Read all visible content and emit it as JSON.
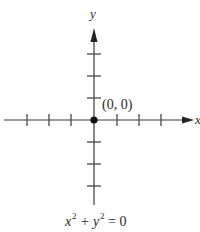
{
  "diagram": {
    "type": "coordinate-plane",
    "axes": {
      "x_label": "x",
      "y_label": "y",
      "x_ticks_each_side": 3,
      "y_ticks_each_side": 3
    },
    "point": {
      "label": "(0, 0)",
      "x": 0,
      "y": 0
    },
    "equation": {
      "x_var": "x",
      "y_var": "y",
      "exponent": "2",
      "plus": "+",
      "equals": "= 0"
    },
    "colors": {
      "axis": "#3a3a3a",
      "point": "#111111",
      "text": "#2a2a2a"
    }
  }
}
